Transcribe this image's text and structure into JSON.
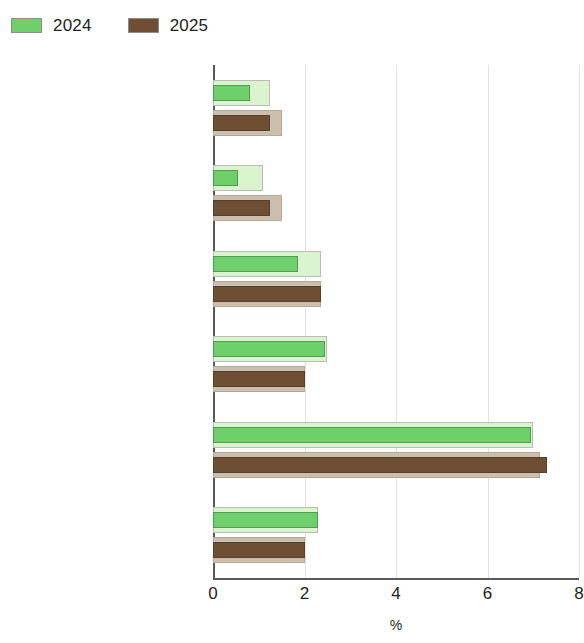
{
  "legend": {
    "entries": [
      {
        "label": "2024",
        "color": "#6fcf6a"
      },
      {
        "label": "2025",
        "color": "#6e4f34"
      }
    ]
  },
  "axis": {
    "x_title": "%",
    "ticks": [
      "0",
      "2",
      "4",
      "6",
      "8"
    ]
  },
  "categories": [
    {
      "label": "East Asia"
    },
    {
      "label": "People’s Republic of China"
    },
    {
      "label": "Hong Kong, China"
    },
    {
      "label": "Republic of Korea"
    },
    {
      "label": "Mongolia"
    },
    {
      "label": "Taipei,China"
    }
  ],
  "chart_data": {
    "type": "bar",
    "orientation": "horizontal",
    "title": "",
    "xlabel": "%",
    "ylabel": "",
    "xlim": [
      0,
      8
    ],
    "xticks": [
      0,
      2,
      4,
      6,
      8
    ],
    "grid": "vertical",
    "legend_position": "top-left",
    "categories": [
      "East Asia",
      "People’s Republic of China",
      "Hong Kong, China",
      "Republic of Korea",
      "Mongolia",
      "Taipei,China"
    ],
    "series": [
      {
        "name": "2024",
        "color": "#6fcf6a",
        "halo_color": "#dcf3cf",
        "values": [
          1.25,
          1.1,
          2.35,
          2.5,
          7.0,
          2.3
        ],
        "inner_values": [
          0.8,
          0.55,
          1.85,
          2.45,
          6.95,
          2.3
        ]
      },
      {
        "name": "2025",
        "color": "#6e4f34",
        "halo_color": "#cdbfae",
        "values": [
          1.5,
          1.5,
          2.35,
          2.0,
          7.15,
          2.0
        ],
        "inner_values": [
          1.25,
          1.25,
          2.35,
          2.0,
          7.3,
          2.0
        ]
      }
    ]
  }
}
